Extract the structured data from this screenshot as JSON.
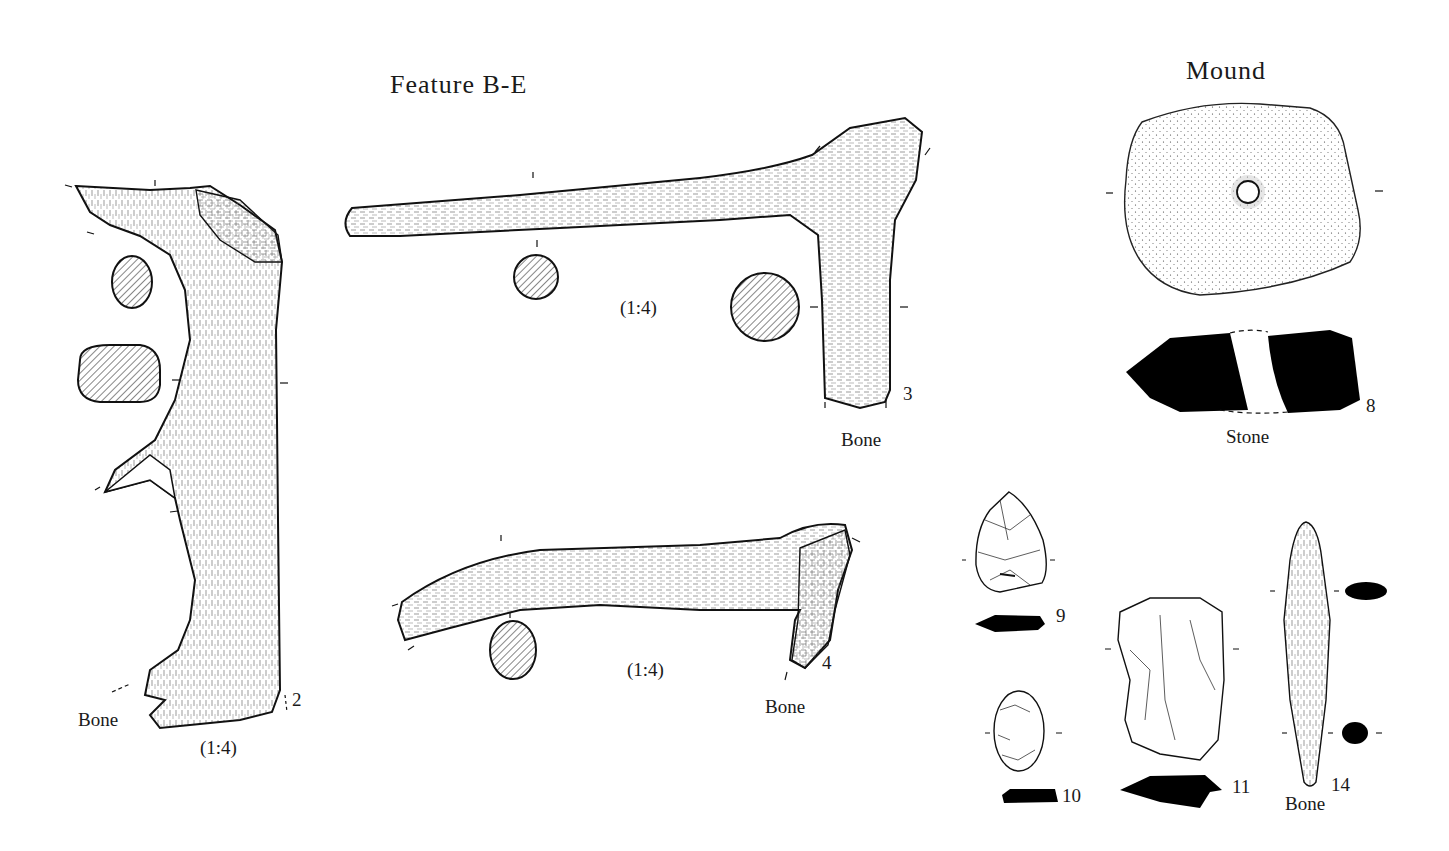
{
  "headings": {
    "feature": "Feature B-E",
    "mound": "Mound"
  },
  "artifacts": [
    {
      "number": "2",
      "material": "Bone",
      "scale": "(1:4)",
      "type": "antler tool with two sections"
    },
    {
      "number": "3",
      "material": "Bone",
      "scale": "(1:4)",
      "type": "antler T-shaped tool with two sections"
    },
    {
      "number": "4",
      "material": "Bone",
      "scale": "(1:4)",
      "type": "antler haft with one section"
    },
    {
      "number": "8",
      "material": "Stone",
      "scale": "",
      "type": "perforated stone with profile"
    },
    {
      "number": "9",
      "material": "",
      "scale": "",
      "type": "flint point with profile"
    },
    {
      "number": "10",
      "material": "",
      "scale": "",
      "type": "flint scraper with profile"
    },
    {
      "number": "11",
      "material": "",
      "scale": "",
      "type": "flint core/blade with profile"
    },
    {
      "number": "14",
      "material": "Bone",
      "scale": "",
      "type": "bone point with two sections"
    }
  ],
  "colors": {
    "ink": "#1a1a1a",
    "paper": "#ffffff",
    "section_fill": "#000000"
  }
}
